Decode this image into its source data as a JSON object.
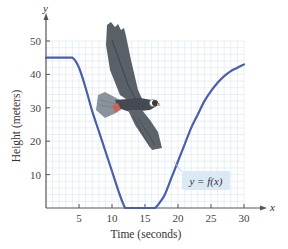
{
  "chart_data": {
    "type": "line",
    "title": "",
    "xlabel": "Time (seconds)",
    "ylabel": "Height (meters)",
    "x_axis_var": "x",
    "y_axis_var": "y",
    "xlim": [
      0,
      30
    ],
    "ylim": [
      0,
      50
    ],
    "x_ticks": [
      5,
      10,
      15,
      20,
      25,
      30
    ],
    "y_ticks": [
      10,
      20,
      30,
      40,
      50
    ],
    "grid": true,
    "legend": {
      "label": "y = f(x)",
      "position": "inside-lower-right"
    },
    "series": [
      {
        "name": "y = f(x)",
        "color": "#4a5fa8",
        "x": [
          0,
          2,
          4,
          5,
          6,
          7,
          8,
          9,
          10,
          11,
          12,
          13,
          14,
          15,
          16,
          16.5,
          17,
          18,
          19,
          20,
          21,
          22,
          23,
          24,
          25,
          26,
          27,
          28,
          29,
          30
        ],
        "y": [
          45,
          45,
          45,
          42,
          36,
          29,
          23,
          17,
          11,
          5,
          0,
          0,
          0,
          0,
          0,
          0,
          1,
          4,
          9,
          14,
          19,
          24,
          28,
          32,
          35,
          37.5,
          39.5,
          41,
          42,
          43
        ]
      }
    ],
    "annotations": [
      "illustration of a soaring hawk above the curve"
    ]
  },
  "labels": {
    "y_var": "y",
    "x_var": "x",
    "y_title": "Height (meters)",
    "x_title": "Time (seconds)",
    "legend": "y = f(x)",
    "yt50": "50",
    "yt40": "40",
    "yt30": "30",
    "yt20": "20",
    "yt10": "10",
    "xt5": "5",
    "xt10": "10",
    "xt15": "15",
    "xt20": "20",
    "xt25": "25",
    "xt30": "30"
  },
  "colors": {
    "curve": "#4a5fa8",
    "grid": "#d6e4f0",
    "axis": "#555555",
    "legend_bg": "#dbe9f4"
  }
}
